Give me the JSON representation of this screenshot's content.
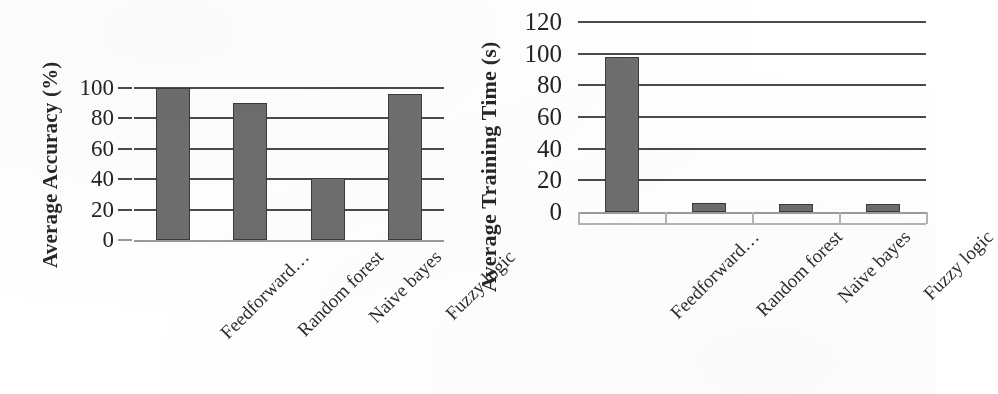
{
  "figure": {
    "background_color": "#ffffff",
    "bar_color": "#6e6e6e",
    "bar_edge_color": "#3a3a3a",
    "grid_color": "#4a4a4a",
    "axis_color": "#9a9a9a"
  },
  "chart_data": [
    {
      "type": "bar",
      "title": "",
      "xlabel": "",
      "ylabel": "Average  Accuracy (%)",
      "categories": [
        "Feedforward…",
        "Random forest",
        "Naive bayes",
        "Fuzzy logic"
      ],
      "values": [
        100,
        90,
        41,
        96
      ],
      "ylim": [
        0,
        100
      ],
      "yticks": [
        0,
        20,
        40,
        60,
        80,
        100
      ],
      "ytick_labels": [
        "0",
        "20",
        "40",
        "60",
        "80",
        "100"
      ],
      "grid": true,
      "grid_axis": "y",
      "legend": false,
      "legend_position": "none",
      "xtick_rotation": -45,
      "series": [
        {
          "name": "Average Accuracy (%)",
          "values": [
            100,
            90,
            41,
            96
          ]
        }
      ]
    },
    {
      "type": "bar",
      "title": "",
      "xlabel": "",
      "ylabel": "Average Training Time (s)",
      "categories": [
        "Feedforward…",
        "Random forest",
        "Naive bayes",
        "Fuzzy logic"
      ],
      "values": [
        98,
        6,
        5,
        5
      ],
      "ylim": [
        0,
        120
      ],
      "yticks": [
        0,
        20,
        40,
        60,
        80,
        100,
        120
      ],
      "ytick_labels": [
        "0",
        "20",
        "40",
        "60",
        "80",
        "100",
        "120"
      ],
      "grid": true,
      "grid_axis": "y",
      "legend": false,
      "legend_position": "none",
      "xtick_rotation": -45,
      "series": [
        {
          "name": "Average Training Time (s)",
          "values": [
            98,
            6,
            5,
            5
          ]
        }
      ]
    }
  ]
}
